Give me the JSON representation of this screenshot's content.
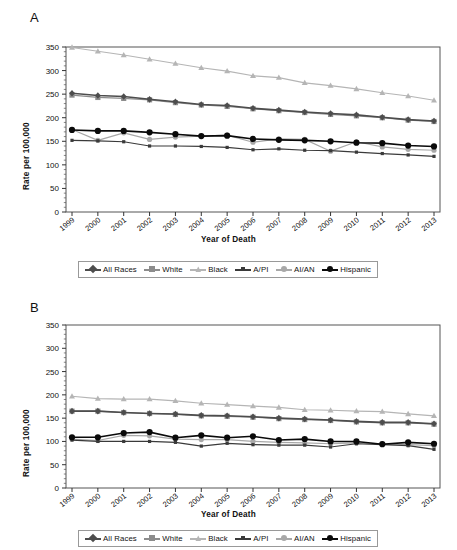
{
  "figure": {
    "panels": [
      {
        "letter": "A",
        "ylabel": "Rate per 100,000",
        "xlabel": "Year of Death"
      },
      {
        "letter": "B",
        "ylabel": "Rate per 100,000",
        "xlabel": "Year of Death"
      }
    ],
    "legend_labels": [
      "All Races",
      "White",
      "Black",
      "A/PI",
      "AI/AN",
      "Hispanic"
    ],
    "series_colors": {
      "All Races": "#4d4d4d",
      "White": "#8c8c8c",
      "Black": "#b5b5b5",
      "A/PI": "#3a3a3a",
      "AI/AN": "#a8a8a8",
      "Hispanic": "#0a0a0a"
    },
    "series_markers": {
      "All Races": "diamond",
      "White": "square",
      "Black": "triangle",
      "A/PI": "dash",
      "AI/AN": "circle",
      "Hispanic": "circle"
    }
  },
  "chart_data": [
    {
      "type": "line",
      "panel": "A",
      "title": "",
      "xlabel": "Year of Death",
      "ylabel": "Rate per 100,000",
      "x": [
        1999,
        2000,
        2001,
        2002,
        2003,
        2004,
        2005,
        2006,
        2007,
        2008,
        2009,
        2010,
        2011,
        2012,
        2013
      ],
      "categories": [
        "1999",
        "2000",
        "2001",
        "2002",
        "2003",
        "2004",
        "2005",
        "2006",
        "2007",
        "2008",
        "2009",
        "2010",
        "2011",
        "2012",
        "2013"
      ],
      "ylim": [
        0,
        350
      ],
      "yticks": [
        0,
        50,
        100,
        150,
        200,
        250,
        300,
        350
      ],
      "grid": false,
      "legend_position": "below",
      "series": [
        {
          "name": "All Races",
          "values": [
            252,
            247,
            245,
            239,
            234,
            228,
            226,
            220,
            216,
            212,
            209,
            206,
            201,
            196,
            193
          ]
        },
        {
          "name": "White",
          "values": [
            248,
            243,
            241,
            238,
            232,
            227,
            224,
            219,
            215,
            211,
            207,
            204,
            200,
            195,
            192
          ]
        },
        {
          "name": "Black",
          "values": [
            349,
            341,
            333,
            324,
            315,
            306,
            299,
            289,
            285,
            274,
            268,
            261,
            253,
            246,
            237
          ]
        },
        {
          "name": "A/PI",
          "values": [
            152,
            151,
            149,
            140,
            140,
            139,
            137,
            132,
            134,
            131,
            130,
            127,
            124,
            121,
            118
          ]
        },
        {
          "name": "AI/AN",
          "values": [
            175,
            152,
            168,
            154,
            159,
            161,
            163,
            148,
            155,
            154,
            129,
            149,
            138,
            133,
            131
          ]
        },
        {
          "name": "Hispanic",
          "values": [
            174,
            172,
            172,
            169,
            165,
            161,
            162,
            155,
            153,
            152,
            150,
            147,
            146,
            141,
            139
          ]
        }
      ]
    },
    {
      "type": "line",
      "panel": "B",
      "title": "",
      "xlabel": "Year of Death",
      "ylabel": "Rate per 100,000",
      "x": [
        1999,
        2000,
        2001,
        2002,
        2003,
        2004,
        2005,
        2006,
        2007,
        2008,
        2009,
        2010,
        2011,
        2012,
        2013
      ],
      "categories": [
        "1999",
        "2000",
        "2001",
        "2002",
        "2003",
        "2004",
        "2005",
        "2006",
        "2007",
        "2008",
        "2009",
        "2010",
        "2011",
        "2012",
        "2013"
      ],
      "ylim": [
        0,
        350
      ],
      "yticks": [
        0,
        50,
        100,
        150,
        200,
        250,
        300,
        350
      ],
      "grid": false,
      "legend_position": "below",
      "series": [
        {
          "name": "All Races",
          "values": [
            165,
            165,
            162,
            160,
            159,
            156,
            155,
            153,
            150,
            148,
            146,
            143,
            141,
            141,
            138
          ]
        },
        {
          "name": "White",
          "values": [
            165,
            165,
            162,
            160,
            158,
            155,
            154,
            152,
            149,
            147,
            145,
            142,
            140,
            140,
            137
          ]
        },
        {
          "name": "Black",
          "values": [
            197,
            192,
            191,
            191,
            187,
            182,
            179,
            176,
            173,
            168,
            167,
            165,
            164,
            159,
            155
          ]
        },
        {
          "name": "A/PI",
          "values": [
            103,
            100,
            100,
            100,
            98,
            90,
            96,
            93,
            92,
            92,
            88,
            95,
            93,
            91,
            83
          ]
        },
        {
          "name": "AI/AN",
          "values": [
            105,
            102,
            113,
            112,
            105,
            104,
            104,
            100,
            98,
            97,
            95,
            97,
            95,
            93,
            91
          ]
        },
        {
          "name": "Hispanic",
          "values": [
            109,
            109,
            118,
            120,
            108,
            113,
            108,
            111,
            103,
            105,
            100,
            100,
            94,
            98,
            95
          ]
        }
      ]
    }
  ]
}
